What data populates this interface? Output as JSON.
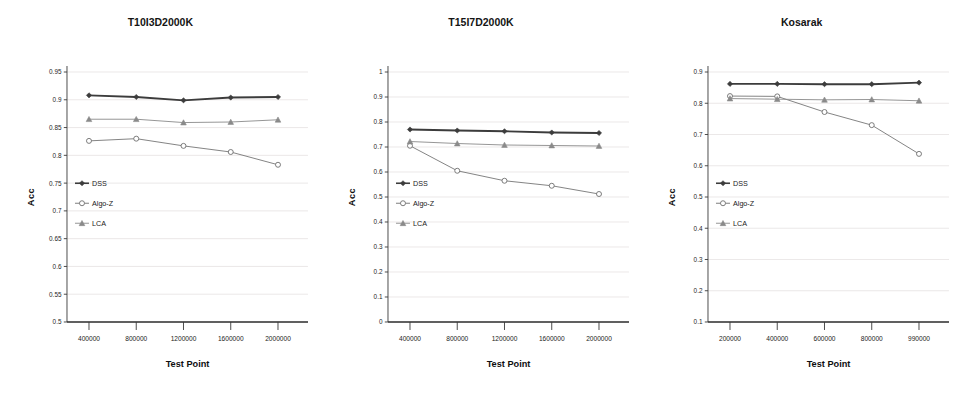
{
  "figure": {
    "panels": [
      {
        "id": "panel-t10i3d2000k",
        "title": "T10I3D2000K",
        "xlabel": "Test Point",
        "ylabel": "Acc"
      },
      {
        "id": "panel-t15i7d2000k",
        "title": "T15I7D2000K",
        "xlabel": "Test Point",
        "ylabel": "Acc"
      },
      {
        "id": "panel-kosarak",
        "title": "Kosarak",
        "xlabel": "Test Point",
        "ylabel": "Acc"
      }
    ],
    "legend": {
      "entries": [
        {
          "label": "DSS",
          "marker": "filled-diamond-marker",
          "color": "#3c3c3c"
        },
        {
          "label": "Algo-Z",
          "marker": "open-circle-marker",
          "color": "#6e6e6e"
        },
        {
          "label": "LCA",
          "marker": "filled-triangle-marker",
          "color": "#8a8a8a"
        }
      ]
    }
  },
  "chart_data": [
    {
      "type": "line",
      "title": "T10I3D2000K",
      "xlabel": "Test Point",
      "ylabel": "Acc",
      "x": [
        400000,
        800000,
        1200000,
        1600000,
        2000000
      ],
      "xtick_labels": [
        "400000",
        "800000",
        "1200000",
        "1600000",
        "2000000"
      ],
      "ylim": [
        0.5,
        0.95
      ],
      "yticks": [
        0.5,
        0.55,
        0.6,
        0.65,
        0.7,
        0.75,
        0.8,
        0.85,
        0.9,
        0.95
      ],
      "ytick_labels": [
        "0.5",
        "0.55",
        "0.6",
        "0.65",
        "0.7",
        "0.75",
        "0.8",
        "0.85",
        "0.9",
        "0.95"
      ],
      "grid": true,
      "legend_position": "center-left",
      "series": [
        {
          "name": "DSS",
          "marker": "filled-diamond",
          "color": "#3c3c3c",
          "values": [
            0.908,
            0.905,
            0.899,
            0.904,
            0.905
          ]
        },
        {
          "name": "Algo-Z",
          "marker": "open-circle",
          "color": "#6e6e6e",
          "values": [
            0.826,
            0.83,
            0.817,
            0.806,
            0.783
          ]
        },
        {
          "name": "LCA",
          "marker": "filled-triangle",
          "color": "#8a8a8a",
          "values": [
            0.865,
            0.865,
            0.859,
            0.86,
            0.864
          ]
        }
      ]
    },
    {
      "type": "line",
      "title": "T15I7D2000K",
      "xlabel": "Test Point",
      "ylabel": "Acc",
      "x": [
        400000,
        800000,
        1200000,
        1600000,
        2000000
      ],
      "xtick_labels": [
        "400000",
        "800000",
        "1200000",
        "1600000",
        "2000000"
      ],
      "ylim": [
        0,
        1
      ],
      "yticks": [
        0,
        0.1,
        0.2,
        0.3,
        0.4,
        0.5,
        0.6,
        0.7,
        0.8,
        0.9,
        1
      ],
      "ytick_labels": [
        "0",
        "0.1",
        "0.2",
        "0.3",
        "0.4",
        "0.5",
        "0.6",
        "0.7",
        "0.8",
        "0.9",
        "1"
      ],
      "grid": true,
      "legend_position": "center-left",
      "series": [
        {
          "name": "DSS",
          "marker": "filled-diamond",
          "color": "#3c3c3c",
          "values": [
            0.77,
            0.766,
            0.763,
            0.758,
            0.756
          ]
        },
        {
          "name": "Algo-Z",
          "marker": "open-circle",
          "color": "#6e6e6e",
          "values": [
            0.705,
            0.605,
            0.565,
            0.545,
            0.512
          ]
        },
        {
          "name": "LCA",
          "marker": "filled-triangle",
          "color": "#8a8a8a",
          "values": [
            0.722,
            0.714,
            0.708,
            0.706,
            0.704
          ]
        }
      ]
    },
    {
      "type": "line",
      "title": "Kosarak",
      "xlabel": "Test Point",
      "ylabel": "Acc",
      "x": [
        200000,
        400000,
        600000,
        800000,
        990000
      ],
      "xtick_labels": [
        "200000",
        "400000",
        "600000",
        "800000",
        "990000"
      ],
      "ylim": [
        0.1,
        0.9
      ],
      "yticks": [
        0.1,
        0.2,
        0.3,
        0.4,
        0.5,
        0.6,
        0.7,
        0.8,
        0.9
      ],
      "ytick_labels": [
        "0.1",
        "0.2",
        "0.3",
        "0.4",
        "0.5",
        "0.6",
        "0.7",
        "0.8",
        "0.9"
      ],
      "grid": true,
      "legend_position": "center-left",
      "series": [
        {
          "name": "DSS",
          "marker": "filled-diamond",
          "color": "#3c3c3c",
          "values": [
            0.862,
            0.862,
            0.861,
            0.861,
            0.866
          ]
        },
        {
          "name": "Algo-Z",
          "marker": "open-circle",
          "color": "#6e6e6e",
          "values": [
            0.823,
            0.822,
            0.772,
            0.73,
            0.638
          ]
        },
        {
          "name": "LCA",
          "marker": "filled-triangle",
          "color": "#8a8a8a",
          "values": [
            0.815,
            0.813,
            0.811,
            0.812,
            0.808
          ]
        }
      ]
    }
  ]
}
